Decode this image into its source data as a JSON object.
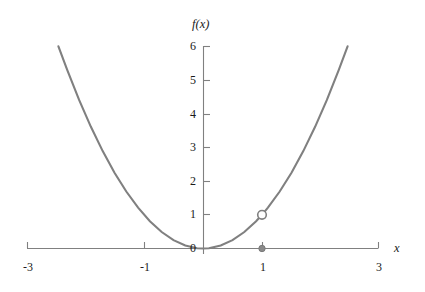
{
  "chart_data": {
    "type": "line",
    "title": "",
    "subtitle": "",
    "xlabel": "x",
    "ylabel": "f(x)",
    "xlim": [
      -3,
      3
    ],
    "ylim": [
      0,
      6
    ],
    "grid": false,
    "legend": null,
    "function": "f(x) = x^2",
    "x_ticks": [
      {
        "value": -3,
        "label": "-3"
      },
      {
        "value": -1,
        "label": "-1"
      },
      {
        "value": 1,
        "label": "1"
      },
      {
        "value": 3,
        "label": "3"
      }
    ],
    "y_ticks": [
      {
        "value": 0,
        "label": "0"
      },
      {
        "value": 1,
        "label": "1"
      },
      {
        "value": 2,
        "label": "2"
      },
      {
        "value": 3,
        "label": "3"
      },
      {
        "value": 4,
        "label": "4"
      },
      {
        "value": 5,
        "label": "5"
      },
      {
        "value": 6,
        "label": "6"
      }
    ],
    "x": [
      -2.45,
      -2.3,
      -2.1,
      -1.9,
      -1.7,
      -1.5,
      -1.3,
      -1.1,
      -0.9,
      -0.7,
      -0.5,
      -0.3,
      -0.1,
      0,
      0.1,
      0.3,
      0.5,
      0.7,
      0.9,
      1,
      1.1,
      1.3,
      1.5,
      1.7,
      1.9,
      2.1,
      2.3,
      2.45
    ],
    "y": [
      6.0,
      5.29,
      4.41,
      3.61,
      2.89,
      2.25,
      1.69,
      1.21,
      0.81,
      0.49,
      0.25,
      0.09,
      0.01,
      0,
      0.01,
      0.09,
      0.25,
      0.49,
      0.81,
      1,
      1.21,
      1.69,
      2.25,
      2.89,
      3.61,
      4.41,
      5.29,
      6.0
    ],
    "markers": [
      {
        "name": "open-circle-discontinuity",
        "x": 1,
        "y": 1,
        "style": "open",
        "label": ""
      },
      {
        "name": "filled-dot-value",
        "x": 1,
        "y": 0,
        "style": "filled",
        "label": ""
      }
    ],
    "colors": {
      "curve": "#808080",
      "axis": "#808080",
      "text": "#1a1a1a",
      "marker_open_fill": "#ffffff",
      "marker_closed_fill": "#8a8a8a",
      "background": "#ffffff"
    }
  }
}
